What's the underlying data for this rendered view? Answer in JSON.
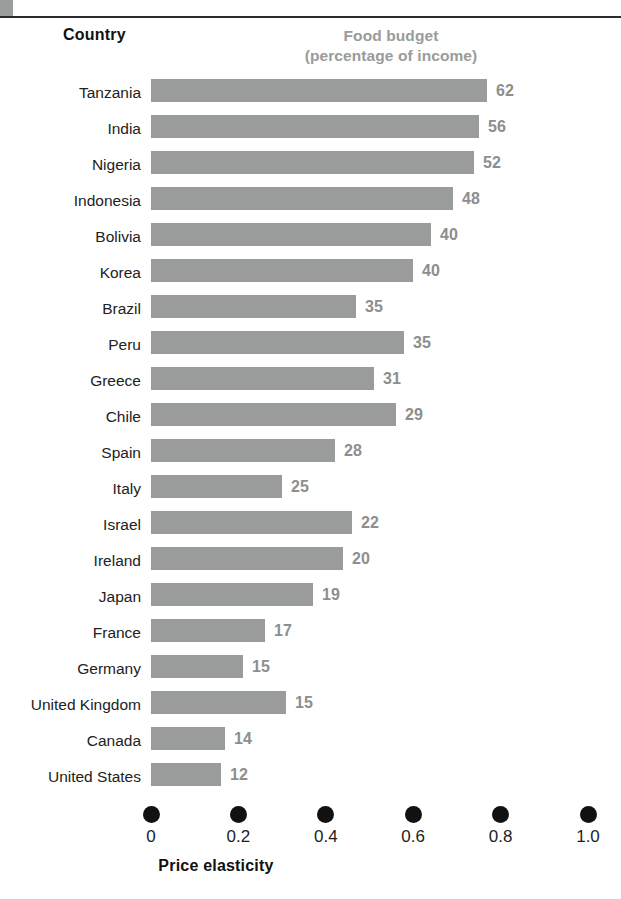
{
  "headers": {
    "country": "Country",
    "budget_line1": "Food budget",
    "budget_line2": "(percentage of income)"
  },
  "axis": {
    "title": "Price elasticity",
    "ticks": [
      "0",
      "0.2",
      "0.4",
      "0.6",
      "0.8",
      "1.0"
    ]
  },
  "colors": {
    "bar": "#9a9b9b",
    "value_text": "#8d8e8e",
    "header_gray": "#9a9b9b",
    "axis_dot": "#111111"
  },
  "chart_data": {
    "type": "bar",
    "xlabel": "Price elasticity",
    "ylabel": "Country",
    "xlim": [
      0,
      1.0
    ],
    "xticks": [
      0,
      0.2,
      0.4,
      0.6,
      0.8,
      1.0
    ],
    "grid": false,
    "legend": "none",
    "orientation": "horizontal",
    "categories": [
      "Tanzania",
      "India",
      "Nigeria",
      "Indonesia",
      "Bolivia",
      "Korea",
      "Brazil",
      "Peru",
      "Greece",
      "Chile",
      "Spain",
      "Italy",
      "Israel",
      "Ireland",
      "Japan",
      "France",
      "Germany",
      "United Kingdom",
      "Canada",
      "United States"
    ],
    "series": [
      {
        "name": "Price elasticity",
        "values": [
          0.77,
          0.75,
          0.74,
          0.69,
          0.64,
          0.6,
          0.47,
          0.58,
          0.51,
          0.56,
          0.42,
          0.3,
          0.46,
          0.44,
          0.37,
          0.26,
          0.21,
          0.31,
          0.17,
          0.16
        ]
      },
      {
        "name": "Food budget (percentage of income)",
        "values": [
          62,
          56,
          52,
          48,
          40,
          40,
          35,
          35,
          31,
          29,
          28,
          25,
          22,
          20,
          19,
          17,
          15,
          15,
          14,
          12
        ]
      }
    ],
    "bar_value_labels": [
      62,
      56,
      52,
      48,
      40,
      40,
      35,
      35,
      31,
      29,
      28,
      25,
      22,
      20,
      19,
      17,
      15,
      15,
      14,
      12
    ]
  },
  "rows": [
    {
      "country": "Tanzania",
      "elasticity": 0.77,
      "budget": "62"
    },
    {
      "country": "India",
      "elasticity": 0.75,
      "budget": "56"
    },
    {
      "country": "Nigeria",
      "elasticity": 0.74,
      "budget": "52"
    },
    {
      "country": "Indonesia",
      "elasticity": 0.69,
      "budget": "48"
    },
    {
      "country": "Bolivia",
      "elasticity": 0.64,
      "budget": "40"
    },
    {
      "country": "Korea",
      "elasticity": 0.6,
      "budget": "40"
    },
    {
      "country": "Brazil",
      "elasticity": 0.47,
      "budget": "35"
    },
    {
      "country": "Peru",
      "elasticity": 0.58,
      "budget": "35"
    },
    {
      "country": "Greece",
      "elasticity": 0.51,
      "budget": "31"
    },
    {
      "country": "Chile",
      "elasticity": 0.56,
      "budget": "29"
    },
    {
      "country": "Spain",
      "elasticity": 0.42,
      "budget": "28"
    },
    {
      "country": "Italy",
      "elasticity": 0.3,
      "budget": "25"
    },
    {
      "country": "Israel",
      "elasticity": 0.46,
      "budget": "22"
    },
    {
      "country": "Ireland",
      "elasticity": 0.44,
      "budget": "20"
    },
    {
      "country": "Japan",
      "elasticity": 0.37,
      "budget": "19"
    },
    {
      "country": "France",
      "elasticity": 0.26,
      "budget": "17"
    },
    {
      "country": "Germany",
      "elasticity": 0.21,
      "budget": "15"
    },
    {
      "country": "United Kingdom",
      "elasticity": 0.31,
      "budget": "15"
    },
    {
      "country": "Canada",
      "elasticity": 0.17,
      "budget": "14"
    },
    {
      "country": "United States",
      "elasticity": 0.16,
      "budget": "12"
    }
  ]
}
